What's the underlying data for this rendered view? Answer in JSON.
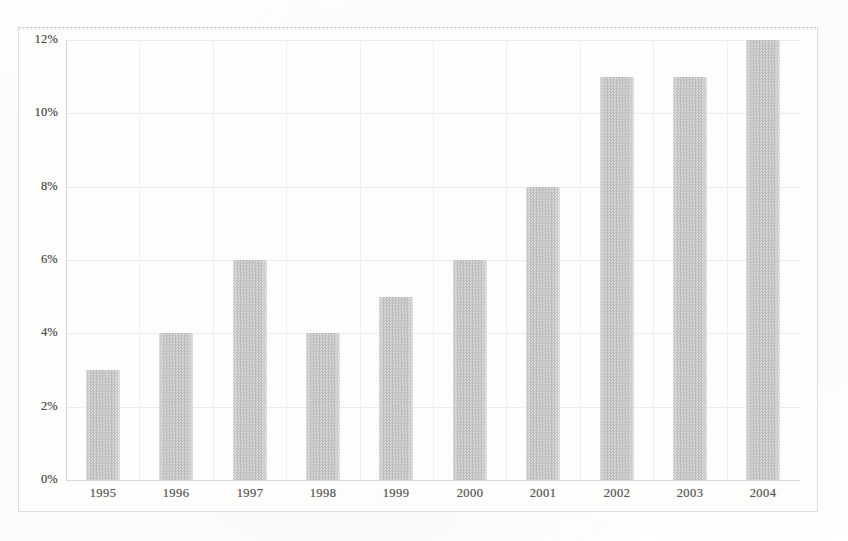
{
  "chart_data": {
    "type": "bar",
    "title": "",
    "subtitle": "",
    "xlabel": "",
    "ylabel": "",
    "categories": [
      "1995",
      "1996",
      "1997",
      "1998",
      "1999",
      "2000",
      "2001",
      "2002",
      "2003",
      "2004"
    ],
    "values": [
      3,
      4,
      6,
      4,
      5,
      6,
      8,
      11,
      11,
      12
    ],
    "value_unit": "%",
    "ylim": [
      0,
      12
    ],
    "ytick_values": [
      0,
      2,
      4,
      6,
      8,
      10,
      12
    ],
    "ytick_labels": [
      "0%",
      "2%",
      "4%",
      "6%",
      "8%",
      "10%",
      "12%"
    ],
    "grid": "horizontal-and-vertical",
    "legend": "none",
    "legend_entries": [],
    "annotations": [],
    "bar_color": "#c6c6c6",
    "gridline_color": "#ecece b",
    "axis_color": "#d3d3d1",
    "background_color": "#fdfdfc",
    "text_color": "#4a4a48"
  }
}
